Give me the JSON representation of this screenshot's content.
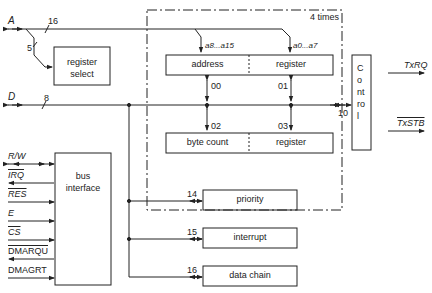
{
  "diagram": {
    "signals": {
      "address_bus": "A",
      "address_width": "16",
      "select_width": "5",
      "data_bus": "D",
      "data_width": "8",
      "tx_rq": "TxRQ",
      "tx_stb": "TxSTB"
    },
    "blocks": {
      "register_select": [
        "register",
        "select"
      ],
      "channel_group_label": "4 times",
      "address": "address",
      "address_register": "register",
      "byte_count": "byte count",
      "count_register": "register",
      "control": "Control",
      "bus_interface": [
        "bus",
        "interface"
      ],
      "priority": "priority",
      "interrupt": "interrupt",
      "data_chain": "data chain"
    },
    "register_offsets": {
      "r00": "00",
      "r01": "01",
      "r02": "02",
      "r03": "03",
      "control": "10",
      "priority": "14",
      "interrupt": "15",
      "data_chain": "16"
    },
    "address_bits": {
      "high": "a8...a15",
      "low": "a0...a7"
    },
    "bus_interface_pins": [
      "R/W",
      "IRQ",
      "RES",
      "E",
      "CS",
      "DMARQU",
      "DMAGRT"
    ]
  }
}
